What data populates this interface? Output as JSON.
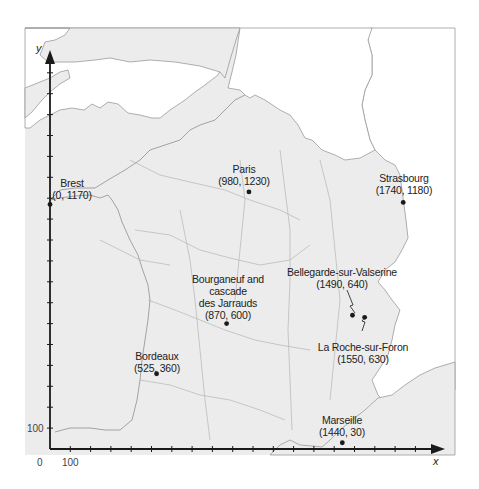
{
  "map": {
    "title": "",
    "colors": {
      "land": "#ececec",
      "sea": "#ffffff",
      "border": "#9a9a9a",
      "axis": "#1a1a1a",
      "point": "#1a1a1a"
    },
    "axes": {
      "x_label": "x",
      "y_label": "y",
      "origin_label": "0",
      "x_tick_label": "100",
      "y_tick_label": "100",
      "tick_interval": 100
    },
    "places": [
      {
        "name": "Brest",
        "coords": "(0, 1170)",
        "x": 0,
        "y": 1170
      },
      {
        "name": "Paris",
        "coords": "(980, 1230)",
        "x": 980,
        "y": 1230
      },
      {
        "name": "Strasbourg",
        "coords": "(1740, 1180)",
        "x": 1740,
        "y": 1180
      },
      {
        "name_lines": [
          "Bourganeuf and",
          "cascade",
          "des Jarrauds"
        ],
        "coords": "(870, 600)",
        "x": 870,
        "y": 600
      },
      {
        "name": "Bellegarde-sur-Valserine",
        "coords": "(1490, 640)",
        "x": 1490,
        "y": 640
      },
      {
        "name": "La Roche-sur-Foron",
        "coords": "(1550, 630)",
        "x": 1550,
        "y": 630
      },
      {
        "name": "Bordeaux",
        "coords": "(525, 360)",
        "x": 525,
        "y": 360
      },
      {
        "name": "Marseille",
        "coords": "(1440, 30)",
        "x": 1440,
        "y": 30
      }
    ]
  }
}
